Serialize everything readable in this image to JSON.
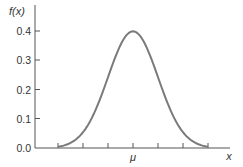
{
  "chart_data": {
    "type": "line",
    "title": "",
    "xlabel": "x",
    "ylabel": "f(x)",
    "x_tick_labels": [
      "",
      "",
      "",
      "μ",
      "",
      "",
      ""
    ],
    "x_ticks_sigma": [
      -3,
      -2,
      -1,
      0,
      1,
      2,
      3
    ],
    "y_ticks": [
      0.0,
      0.1,
      0.2,
      0.3,
      0.4
    ],
    "y_tick_labels": [
      "0.0",
      "0.1",
      "0.2",
      "0.3",
      "0.4"
    ],
    "ylim": [
      0.0,
      0.4
    ],
    "xlim_sigma": [
      -3.5,
      3.9
    ],
    "series": [
      {
        "name": "Standard normal density",
        "distribution": "normal",
        "mean_label": "μ",
        "peak": 0.4,
        "color": "#7a7a7a",
        "x": [
          -3.2,
          -3,
          -2.5,
          -2,
          -1.5,
          -1,
          -0.5,
          0,
          0.5,
          1,
          1.5,
          2,
          2.5,
          3,
          3.2
        ],
        "values": [
          0.002,
          0.004,
          0.018,
          0.054,
          0.13,
          0.242,
          0.352,
          0.399,
          0.352,
          0.242,
          0.13,
          0.054,
          0.018,
          0.004,
          0.002
        ]
      }
    ],
    "grid": false,
    "legend": null
  },
  "labels": {
    "ylabel": "f(x)",
    "xlabel": "x",
    "mu": "μ",
    "y0": "0.0",
    "y1": "0.1",
    "y2": "0.2",
    "y3": "0.3",
    "y4": "0.4"
  }
}
